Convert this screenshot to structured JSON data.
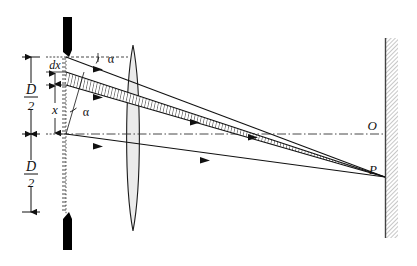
{
  "figure": {
    "type": "optics-ray-diagram",
    "background_color": "#ffffff",
    "ink_color": "#111111"
  },
  "labels": {
    "aperture_half_upper": {
      "num": "D",
      "den": "2"
    },
    "aperture_half_lower": {
      "num": "D",
      "den": "2"
    },
    "differential": "dx",
    "position": "x",
    "angle_upper": "α",
    "angle_lower": "α",
    "axis_point": "O",
    "focus_point": "P"
  },
  "elements": {
    "slit_top_blade": "aperture-blade-top",
    "slit_bottom_blade": "aperture-blade-bottom",
    "lens": "converging-lens",
    "screen": "observation-screen",
    "optical_axis": "optical-axis",
    "ray_band": "differential-ray-band",
    "rays": [
      "ray-top-edge",
      "ray-band-upper",
      "ray-band-lower",
      "ray-axis"
    ]
  },
  "geometry": {
    "slit_x": 66,
    "slit_top_y": 57,
    "slit_bottom_y": 134,
    "slit_bottom_extent": 212,
    "lens_center_x": 133,
    "lens_top_y": 45,
    "lens_bottom_y": 231,
    "screen_x": 385,
    "axis_y": 134,
    "focus_x": 385,
    "focus_y": 177,
    "dx_top_y": 72,
    "dx_bottom_y": 85
  },
  "colors": {
    "lens_fill": "#ebebeb",
    "screen_hatch": "#b8b8b8",
    "band_fill": "#f2f2f2",
    "blade": "#000000"
  }
}
